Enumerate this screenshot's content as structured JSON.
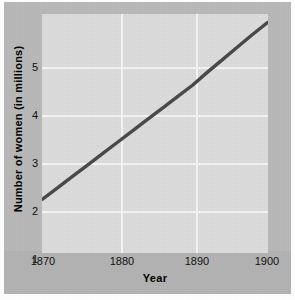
{
  "chart_data": {
    "type": "line",
    "title": "",
    "xlabel": "Year",
    "ylabel": "Number of women (in millions)",
    "xlim": [
      1870,
      1900
    ],
    "ylim": [
      1,
      5
    ],
    "xticks": [
      1870,
      1880,
      1890,
      1900
    ],
    "xtick_labels": [
      "1870",
      "1880",
      "1890",
      "1900"
    ],
    "yticks": [
      1,
      2,
      3,
      4,
      5
    ],
    "ytick_labels": [
      "1",
      "2",
      "3",
      "4",
      "5"
    ],
    "grid": true,
    "legend": "none",
    "series": [
      {
        "name": "Number of women",
        "color": "#4a4a4a",
        "x": [
          1870,
          1872,
          1874,
          1876,
          1878,
          1880,
          1882,
          1884,
          1886,
          1888,
          1890,
          1892,
          1894,
          1896,
          1898,
          1900
        ],
        "values": [
          1.75,
          1.95,
          2.15,
          2.35,
          2.55,
          2.75,
          2.95,
          3.15,
          3.35,
          3.55,
          3.75,
          3.98,
          4.2,
          4.42,
          4.64,
          4.85
        ]
      }
    ],
    "annotations": []
  },
  "colors": {
    "mat": "#b9b9b9",
    "mat_band": "#b3b3b3",
    "panel": "#dcdcdc",
    "gridline": "#f4f4f4",
    "line": "#4a4a4a",
    "text": "#111111"
  }
}
